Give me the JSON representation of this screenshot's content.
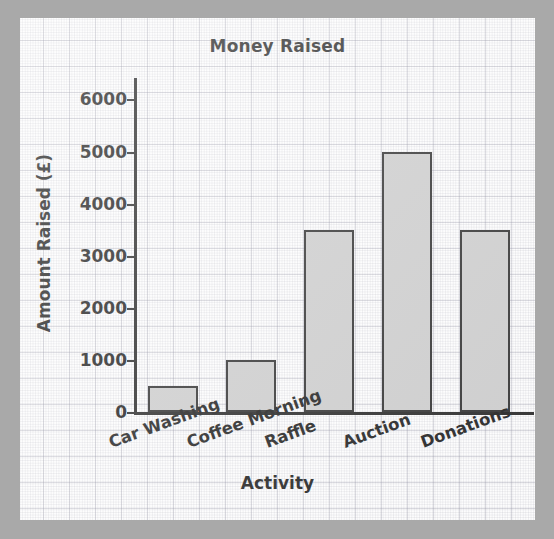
{
  "chart_data": {
    "type": "bar",
    "title": "Money Raised",
    "xlabel": "Activity",
    "ylabel": "Amount Raised (£)",
    "categories": [
      "Car Washing",
      "Coffee Morning",
      "Raffle",
      "Auction",
      "Donations"
    ],
    "values": [
      500,
      1000,
      3500,
      5000,
      3500
    ],
    "ylim": [
      0,
      6500
    ],
    "yticks": [
      0,
      1000,
      2000,
      3000,
      4000,
      5000,
      6000
    ],
    "ytick_labels": [
      "0",
      "1000",
      "2000",
      "3000",
      "4000",
      "5000",
      "6000"
    ],
    "grid": true,
    "legend": null,
    "bar_fill_color": "#c9c9c9",
    "bar_edge_color": "#262626",
    "axis_color": "#1d1d1d",
    "background_color": "#fdfdfd",
    "frame_color": "#a9a9a9"
  }
}
